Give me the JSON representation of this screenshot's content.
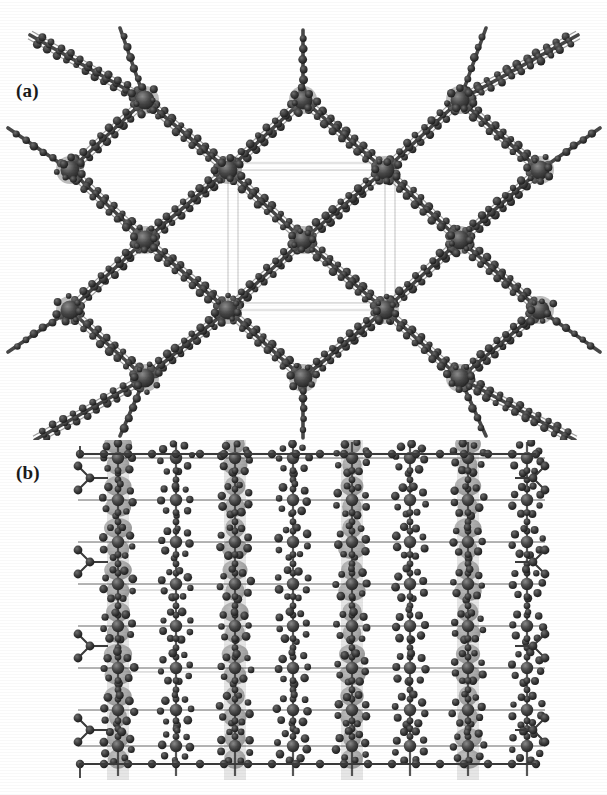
{
  "figure": {
    "type": "crystal-structure-figure",
    "background_color": "#ffffff",
    "rendering": "grayscale ball-and-stick / polyhedral packing diagram (scanned)",
    "panels": [
      {
        "id": "a",
        "label": "(a)",
        "caption_text": "(a)",
        "view": "diamondoid rhombic net viewed down one axis",
        "description": "Interpenetrated rhombic (diamond-like) coordination network. Large dark metal nodes sit at the vertices of the rhombs and are bridged by multi-atom organic linker chains drawn as rows of small dark spheres. Faint light-grey lines mark the crystallographic unit-cell box at the centre.",
        "node_color": "#3d3d3d",
        "atom_color": "#2b2b2b",
        "bond_color": "#555555",
        "unitcell_color": "#c9c9c9"
      },
      {
        "id": "b",
        "label": "(b)",
        "caption_text": "(b)",
        "view": "perpendicular packing view along the channel axis",
        "description": "Dense square-grid packing view showing vertical columns of grey metal polyhedra linked horizontally and vertically by organic ligands; small dark spheres form ring and chain motifs between the columns. Faint grey unit-cell lines cross the centre.",
        "node_color": "#3d3d3d",
        "atom_color": "#2b2b2b",
        "bond_color": "#555555",
        "polyhedron_color": "#9a9a9a",
        "unitcell_color": "#c9c9c9"
      }
    ]
  },
  "chart_data": {
    "type": "diagram",
    "title": "",
    "xlabel": "",
    "ylabel": "",
    "panels": [
      {
        "label": "(a)",
        "lattice": "rhombic / diamondoid net",
        "node_positions": [
          [
            145,
            100
          ],
          [
            303,
            100
          ],
          [
            460,
            100
          ],
          [
            70,
            170
          ],
          [
            228,
            170
          ],
          [
            385,
            170
          ],
          [
            540,
            170
          ],
          [
            145,
            240
          ],
          [
            303,
            240
          ],
          [
            460,
            240
          ],
          [
            70,
            310
          ],
          [
            228,
            310
          ],
          [
            385,
            310
          ],
          [
            540,
            310
          ],
          [
            145,
            378
          ],
          [
            303,
            378
          ],
          [
            460,
            378
          ]
        ],
        "unit_cell_box": {
          "x": 228,
          "y": 170,
          "width": 157,
          "height": 140
        },
        "chain_terminations": [
          [
            30,
            35
          ],
          [
            578,
            35
          ],
          [
            35,
            412
          ],
          [
            575,
            412
          ]
        ]
      },
      {
        "label": "(b)",
        "lattice": "square grid with columnar metal stacks",
        "column_x_positions": [
          118,
          235,
          352,
          468
        ],
        "row_y_positions": [
          478,
          520,
          562,
          604,
          646,
          688,
          730,
          762
        ],
        "bounds": {
          "x": 75,
          "y": 458,
          "width": 470,
          "height": 312
        }
      }
    ]
  }
}
